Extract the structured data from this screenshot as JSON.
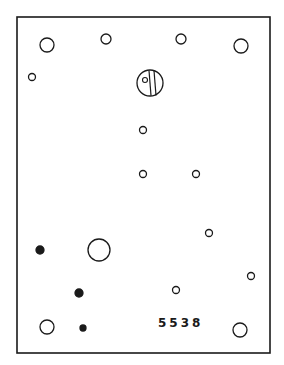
{
  "diagram": {
    "part_number": "5538",
    "stroke_color": "#1a1a1a",
    "background": "#ffffff",
    "panel": {
      "x": 17,
      "y": 17,
      "width": 253,
      "height": 336
    },
    "holes": [
      {
        "id": "top-left-large",
        "cx": 47,
        "cy": 45,
        "r": 7,
        "filled": false
      },
      {
        "id": "top-mid-left",
        "cx": 106,
        "cy": 39,
        "r": 5,
        "filled": false
      },
      {
        "id": "top-mid-right",
        "cx": 181,
        "cy": 39,
        "r": 5,
        "filled": false
      },
      {
        "id": "top-right-large",
        "cx": 241,
        "cy": 46,
        "r": 7,
        "filled": false
      },
      {
        "id": "left-small",
        "cx": 32,
        "cy": 77,
        "r": 3.5,
        "filled": false
      },
      {
        "id": "center-1",
        "cx": 143,
        "cy": 130,
        "r": 3.5,
        "filled": false
      },
      {
        "id": "center-2",
        "cx": 143,
        "cy": 174,
        "r": 3.5,
        "filled": false
      },
      {
        "id": "center-3",
        "cx": 196,
        "cy": 174,
        "r": 3.5,
        "filled": false
      },
      {
        "id": "right-1",
        "cx": 209,
        "cy": 233,
        "r": 3.5,
        "filled": false
      },
      {
        "id": "left-filled-1",
        "cx": 40,
        "cy": 250,
        "r": 4,
        "filled": true
      },
      {
        "id": "big-hole",
        "cx": 99,
        "cy": 250,
        "r": 11,
        "filled": false
      },
      {
        "id": "right-2",
        "cx": 251,
        "cy": 276,
        "r": 3.5,
        "filled": false
      },
      {
        "id": "left-filled-2",
        "cx": 79,
        "cy": 293,
        "r": 4,
        "filled": true
      },
      {
        "id": "bottom-mid",
        "cx": 176,
        "cy": 290,
        "r": 3.5,
        "filled": false
      },
      {
        "id": "bottom-left-large",
        "cx": 47,
        "cy": 327,
        "r": 7,
        "filled": false
      },
      {
        "id": "bottom-filled",
        "cx": 83,
        "cy": 328,
        "r": 3,
        "filled": true
      },
      {
        "id": "bottom-right-large",
        "cx": 240,
        "cy": 330,
        "r": 7,
        "filled": false
      }
    ],
    "screw": {
      "cx": 150,
      "cy": 83,
      "r": 13,
      "slot_x1": 149,
      "slot_x2": 154,
      "pin": {
        "cx": 145,
        "cy": 80,
        "r": 2.5
      }
    }
  }
}
